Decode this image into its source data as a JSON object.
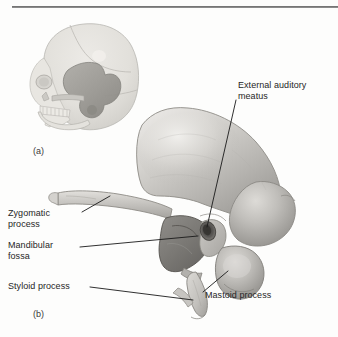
{
  "figure": {
    "background_color": "#fdfdfc",
    "text_color": "#262626",
    "leader_line_color": "#1a1a1a"
  },
  "panels": [
    {
      "tag": "(a)",
      "description": "Lateral view of skull with temporal bone shaded"
    },
    {
      "tag": "(b)",
      "description": "Isolated lateral view of right temporal bone"
    }
  ],
  "labels": [
    {
      "id": "external-auditory-meatus",
      "text": "External auditory\nmeatus"
    },
    {
      "id": "zygomatic-process",
      "text": "Zygomatic\nprocess"
    },
    {
      "id": "mandibular-fossa",
      "text": "Mandibular\nfossa"
    },
    {
      "id": "styloid-process",
      "text": "Styloid process"
    },
    {
      "id": "mastoid-process",
      "text": "Mastoid process"
    }
  ]
}
